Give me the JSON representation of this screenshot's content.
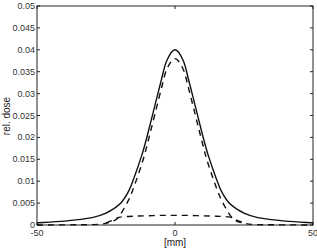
{
  "chart_data": {
    "type": "line",
    "title": "",
    "xlabel": "[mm]",
    "ylabel": "rel. dose",
    "xlim": [
      -50,
      50
    ],
    "ylim": [
      0,
      0.05
    ],
    "grid": false,
    "legend": null,
    "x_ticks": [
      -50,
      0,
      50
    ],
    "x_tick_labels": [
      "-50",
      "0",
      "50"
    ],
    "y_ticks": [
      0,
      0.005,
      0.01,
      0.015,
      0.02,
      0.025,
      0.03,
      0.035,
      0.04,
      0.045,
      0.05
    ],
    "y_tick_labels": [
      "0",
      "0.005",
      "0.01",
      "0.015",
      "0.02",
      "0.025",
      "0.03",
      "0.035",
      "0.04",
      "0.045",
      "0.05"
    ],
    "series": [
      {
        "name": "total",
        "style": "solid",
        "x": [
          -50,
          -40,
          -30,
          -25,
          -20,
          -17,
          -15,
          -12,
          -10,
          -8,
          -5,
          -3,
          0,
          3,
          5,
          8,
          10,
          12,
          15,
          17,
          20,
          25,
          30,
          40,
          50
        ],
        "y": [
          0.0005,
          0.0009,
          0.0017,
          0.0027,
          0.0048,
          0.0075,
          0.0105,
          0.016,
          0.0205,
          0.0255,
          0.033,
          0.0375,
          0.04,
          0.0375,
          0.033,
          0.0255,
          0.0205,
          0.016,
          0.0105,
          0.0075,
          0.0048,
          0.0027,
          0.0017,
          0.0009,
          0.0005
        ]
      },
      {
        "name": "primary",
        "style": "dashed",
        "x": [
          -50,
          -30,
          -25,
          -22,
          -20,
          -17,
          -15,
          -12,
          -10,
          -8,
          -5,
          -3,
          0,
          3,
          5,
          8,
          10,
          12,
          15,
          17,
          20,
          22,
          25,
          30,
          50
        ],
        "y": [
          0.0,
          0.0001,
          0.0004,
          0.001,
          0.0022,
          0.0055,
          0.0085,
          0.014,
          0.0185,
          0.0235,
          0.031,
          0.0355,
          0.038,
          0.0355,
          0.031,
          0.0235,
          0.0185,
          0.014,
          0.0085,
          0.0055,
          0.0022,
          0.001,
          0.0004,
          0.0001,
          0.0
        ]
      },
      {
        "name": "scatter",
        "style": "dashed",
        "x": [
          -25,
          -22,
          -20,
          -15,
          -10,
          -5,
          0,
          5,
          10,
          15,
          20,
          22,
          25
        ],
        "y": [
          0.0005,
          0.0012,
          0.0018,
          0.002,
          0.0021,
          0.0022,
          0.0022,
          0.0022,
          0.0021,
          0.002,
          0.0018,
          0.0012,
          0.0005
        ]
      }
    ]
  }
}
